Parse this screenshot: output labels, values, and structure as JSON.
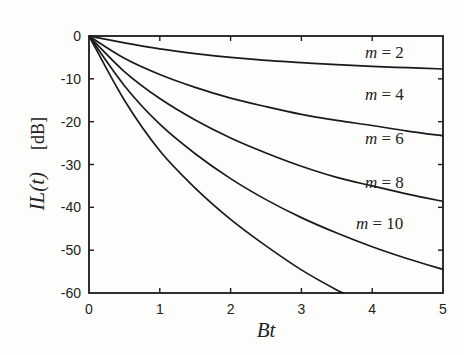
{
  "chart_data": {
    "type": "line",
    "title": "",
    "xlabel": "Bt",
    "ylabel": "IL(t)",
    "ylabel_unit": "[dB]",
    "xlim": [
      0,
      5
    ],
    "ylim": [
      -60,
      0
    ],
    "grid": false,
    "x_ticks": [
      0,
      1,
      2,
      3,
      4,
      5
    ],
    "x_tick_labels": [
      "0",
      "1",
      "2",
      "3",
      "4",
      "5"
    ],
    "y_ticks": [
      0,
      -10,
      -20,
      -30,
      -40,
      -50,
      -60
    ],
    "y_tick_labels": [
      "0",
      "-10",
      "-20",
      "-30",
      "-40",
      "-50",
      "-60"
    ],
    "x": [
      0,
      0.5,
      1,
      1.5,
      2,
      2.5,
      3,
      3.5,
      4,
      4.5,
      5
    ],
    "series": [
      {
        "name": "m = 2",
        "label": "m = 2",
        "values": [
          0,
          -1.6,
          -3.0,
          -4.1,
          -5.0,
          -5.7,
          -6.2,
          -6.7,
          -7.1,
          -7.4,
          -7.7
        ]
      },
      {
        "name": "m = 4",
        "label": "m = 4",
        "values": [
          0,
          -5.2,
          -9.0,
          -12.0,
          -14.5,
          -16.5,
          -18.3,
          -19.7,
          -20.9,
          -22.2,
          -23.3
        ]
      },
      {
        "name": "m = 6",
        "label": "m = 6",
        "values": [
          0,
          -8.3,
          -14.6,
          -19.6,
          -23.8,
          -27.3,
          -30.4,
          -33.0,
          -35.0,
          -36.9,
          -38.6
        ]
      },
      {
        "name": "m = 8",
        "label": "m = 8",
        "values": [
          0,
          -11.6,
          -20.6,
          -27.5,
          -33.3,
          -38.2,
          -42.4,
          -46.0,
          -49.2,
          -52.0,
          -54.5
        ]
      },
      {
        "name": "m = 10",
        "label": "m = 10",
        "values": [
          0,
          -15.0,
          -26.8,
          -35.5,
          -42.8,
          -49.0,
          -54.6,
          -59.3,
          null,
          null,
          null
        ],
        "end_point": [
          3.6,
          -60
        ]
      }
    ],
    "legend": "inline-right"
  }
}
